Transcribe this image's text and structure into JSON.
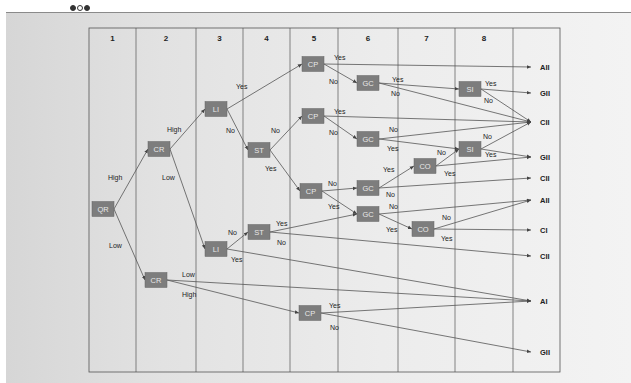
{
  "header": {
    "window_dots": [
      "filled",
      "hollow",
      "filled"
    ]
  },
  "grid": {
    "columns": [
      "1",
      "2",
      "3",
      "4",
      "5",
      "6",
      "7",
      "8",
      ""
    ],
    "column_x": [
      89,
      136,
      196,
      243,
      290,
      338,
      398,
      455,
      513,
      560
    ],
    "top": 28,
    "bottom": 372,
    "header_height": 18
  },
  "nodes": [
    {
      "id": "QR",
      "label": "QR",
      "x": 103,
      "y": 209
    },
    {
      "id": "CR1",
      "label": "CR",
      "x": 159,
      "y": 149
    },
    {
      "id": "CR2",
      "label": "CR",
      "x": 156,
      "y": 280
    },
    {
      "id": "LI1",
      "label": "LI",
      "x": 216,
      "y": 109
    },
    {
      "id": "LI2",
      "label": "LI",
      "x": 216,
      "y": 249
    },
    {
      "id": "ST1",
      "label": "ST",
      "x": 259,
      "y": 150
    },
    {
      "id": "ST2",
      "label": "ST",
      "x": 259,
      "y": 232
    },
    {
      "id": "CP1",
      "label": "CP",
      "x": 313,
      "y": 64
    },
    {
      "id": "CP2",
      "label": "CP",
      "x": 313,
      "y": 116
    },
    {
      "id": "CP3",
      "label": "CP",
      "x": 311,
      "y": 191
    },
    {
      "id": "CP4",
      "label": "CP",
      "x": 310,
      "y": 313
    },
    {
      "id": "GC1",
      "label": "GC",
      "x": 368,
      "y": 83
    },
    {
      "id": "GC2",
      "label": "GC",
      "x": 368,
      "y": 139
    },
    {
      "id": "GC3",
      "label": "GC",
      "x": 368,
      "y": 188
    },
    {
      "id": "GC4",
      "label": "GC",
      "x": 368,
      "y": 214
    },
    {
      "id": "CO1",
      "label": "CO",
      "x": 425,
      "y": 166
    },
    {
      "id": "CO2",
      "label": "CO",
      "x": 423,
      "y": 229
    },
    {
      "id": "SI1",
      "label": "SI",
      "x": 470,
      "y": 89
    },
    {
      "id": "SI2",
      "label": "SI",
      "x": 470,
      "y": 149
    }
  ],
  "outcomes": [
    {
      "id": "o1",
      "label": "AII",
      "x": 540,
      "y": 67
    },
    {
      "id": "o2",
      "label": "GII",
      "x": 540,
      "y": 93
    },
    {
      "id": "o3",
      "label": "CII",
      "x": 540,
      "y": 122
    },
    {
      "id": "o4",
      "label": "GII",
      "x": 540,
      "y": 157
    },
    {
      "id": "o5",
      "label": "CII",
      "x": 540,
      "y": 178
    },
    {
      "id": "o6",
      "label": "AII",
      "x": 540,
      "y": 200
    },
    {
      "id": "o7",
      "label": "CI",
      "x": 540,
      "y": 230
    },
    {
      "id": "o8",
      "label": "CII",
      "x": 540,
      "y": 256
    },
    {
      "id": "o9",
      "label": "AI",
      "x": 540,
      "y": 301
    },
    {
      "id": "o10",
      "label": "GII",
      "x": 540,
      "y": 352
    }
  ],
  "edges": [
    {
      "from": "QR",
      "to": "CR1",
      "label": "High",
      "lx": 108,
      "ly": 180
    },
    {
      "from": "QR",
      "to": "CR2",
      "label": "Low",
      "lx": 109,
      "ly": 248
    },
    {
      "from": "CR1",
      "to": "LI1",
      "label": "High",
      "lx": 167,
      "ly": 132
    },
    {
      "from": "CR1",
      "to": "LI2",
      "label": "Low",
      "lx": 162,
      "ly": 180
    },
    {
      "from": "LI1",
      "to": "CP1",
      "label": "Yes",
      "lx": 236,
      "ly": 89
    },
    {
      "from": "LI1",
      "to": "ST1",
      "label": "No",
      "lx": 226,
      "ly": 133
    },
    {
      "from": "ST1",
      "to": "CP2",
      "label": "No",
      "lx": 271,
      "ly": 133
    },
    {
      "from": "ST1",
      "to": "CP3",
      "label": "Yes",
      "lx": 265,
      "ly": 171
    },
    {
      "from": "CP1",
      "to": "o1",
      "label": "Yes",
      "lx": 334,
      "ly": 60
    },
    {
      "from": "CP1",
      "to": "GC1",
      "label": "No",
      "lx": 329,
      "ly": 84
    },
    {
      "from": "CP2",
      "to": "o3",
      "label": "Yes",
      "lx": 334,
      "ly": 114
    },
    {
      "from": "CP2",
      "to": "GC2",
      "label": "No",
      "lx": 329,
      "ly": 135
    },
    {
      "from": "CP3",
      "to": "GC3",
      "label": "No",
      "lx": 328,
      "ly": 186
    },
    {
      "from": "CP3",
      "to": "GC4",
      "label": "Yes",
      "lx": 328,
      "ly": 209
    },
    {
      "from": "GC1",
      "to": "SI1",
      "label": "Yes",
      "lx": 392,
      "ly": 82
    },
    {
      "from": "GC1",
      "to": "o3",
      "label": "No",
      "lx": 391,
      "ly": 96
    },
    {
      "from": "GC2",
      "to": "o3",
      "label": "No",
      "lx": 389,
      "ly": 132
    },
    {
      "from": "GC2",
      "to": "SI2",
      "label": "Yes",
      "lx": 387,
      "ly": 151
    },
    {
      "from": "GC3",
      "to": "CO1",
      "label": "Yes",
      "lx": 383,
      "ly": 172
    },
    {
      "from": "GC3",
      "to": "o5",
      "label": "No",
      "lx": 386,
      "ly": 197
    },
    {
      "from": "GC4",
      "to": "o6",
      "label": "No",
      "lx": 389,
      "ly": 209
    },
    {
      "from": "GC4",
      "to": "CO2",
      "label": "Yes",
      "lx": 386,
      "ly": 232
    },
    {
      "from": "CO1",
      "to": "SI2",
      "label": "No",
      "lx": 437,
      "ly": 155
    },
    {
      "from": "CO1",
      "to": "o4",
      "label": "Yes",
      "lx": 444,
      "ly": 176
    },
    {
      "from": "CO2",
      "to": "o6",
      "label": "No",
      "lx": 442,
      "ly": 220
    },
    {
      "from": "CO2",
      "to": "o7",
      "label": "Yes",
      "lx": 441,
      "ly": 241
    },
    {
      "from": "SI1",
      "to": "o2",
      "label": "Yes",
      "lx": 485,
      "ly": 86
    },
    {
      "from": "SI1",
      "to": "o3",
      "label": "No",
      "lx": 484,
      "ly": 103
    },
    {
      "from": "SI2",
      "to": "o3",
      "label": "No",
      "lx": 483,
      "ly": 139
    },
    {
      "from": "SI2",
      "to": "o4",
      "label": "Yes",
      "lx": 485,
      "ly": 157
    },
    {
      "from": "LI2",
      "to": "ST2",
      "label": "No",
      "lx": 228,
      "ly": 235
    },
    {
      "from": "LI2",
      "to": "o9",
      "label": "Yes",
      "lx": 231,
      "ly": 262
    },
    {
      "from": "ST2",
      "to": "GC4",
      "label": "Yes",
      "lx": 276,
      "ly": 226
    },
    {
      "from": "ST2",
      "to": "o8",
      "label": "No",
      "lx": 277,
      "ly": 245
    },
    {
      "from": "CR2",
      "to": "o9",
      "label": "Low",
      "lx": 182,
      "ly": 277
    },
    {
      "from": "CR2",
      "to": "CP4",
      "label": "High",
      "lx": 182,
      "ly": 297
    },
    {
      "from": "CP4",
      "to": "o9",
      "label": "Yes",
      "lx": 329,
      "ly": 308
    },
    {
      "from": "CP4",
      "to": "o10",
      "label": "No",
      "lx": 330,
      "ly": 330
    }
  ]
}
